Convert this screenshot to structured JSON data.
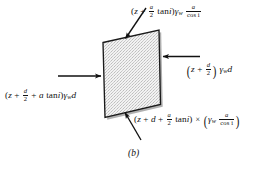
{
  "figure": {
    "caption": "(b)",
    "shape": {
      "name": "parallelogram-element",
      "fill": "#e9e9e9",
      "stroke": "#1a1a1a",
      "texture": "stipple-dots"
    },
    "colors": {
      "background": "#ffffff",
      "ink": "#111111",
      "fill": "#e9e9e9"
    },
    "labels": {
      "top": {
        "name": "force-label-top",
        "plain": "(z + a/2 tan i) γw a/cos i",
        "parts": {
          "open": "(",
          "z": "z",
          "plus1": " + ",
          "frac_num": "a",
          "frac_den": "2",
          "tan": "tan",
          "i1": "i",
          "close": ")",
          "gamma": "γ",
          "gamma_sub": "w",
          "frac2_num": "a",
          "frac2_den": "cos i"
        }
      },
      "right": {
        "name": "force-label-right",
        "plain": "(z + d/2) γw d",
        "parts": {
          "open": "(",
          "z": "z",
          "plus1": " + ",
          "frac_num": "d",
          "frac_den": "2",
          "close": ")",
          "gamma": "γ",
          "gamma_sub": "w",
          "d": "d"
        }
      },
      "left": {
        "name": "force-label-left",
        "plain": "(z + d/2 + a tan i) γw d",
        "parts": {
          "open": "(",
          "z": "z",
          "plus1": " + ",
          "frac_num": "d",
          "frac_den": "2",
          "plus2": " + ",
          "a": "a",
          "tan": "tan",
          "i1": "i",
          "close": ")",
          "gamma": "γ",
          "gamma_sub": "w",
          "d": "d"
        }
      },
      "bottom": {
        "name": "force-label-bottom",
        "plain": "(z + d + a/2 tan i) × (γw a/cos i)",
        "parts": {
          "open": "(",
          "z": "z",
          "plus1": " + ",
          "d": "d",
          "plus2": " + ",
          "frac_num": "a",
          "frac_den": "2",
          "tan": "tan",
          "i1": "i",
          "close": ")",
          "times": "×",
          "open2": "(",
          "gamma": "γ",
          "gamma_sub": "w",
          "frac2_num": "a",
          "frac2_den": "cos i",
          "close2": ")"
        }
      }
    },
    "arrows": [
      {
        "name": "arrow-top",
        "direction": "down-left",
        "points_to": "top-edge"
      },
      {
        "name": "arrow-right",
        "direction": "left",
        "points_to": "right-edge"
      },
      {
        "name": "arrow-left",
        "direction": "right",
        "points_to": "left-edge"
      },
      {
        "name": "arrow-bottom",
        "direction": "up-right",
        "points_to": "bottom-edge"
      }
    ]
  }
}
